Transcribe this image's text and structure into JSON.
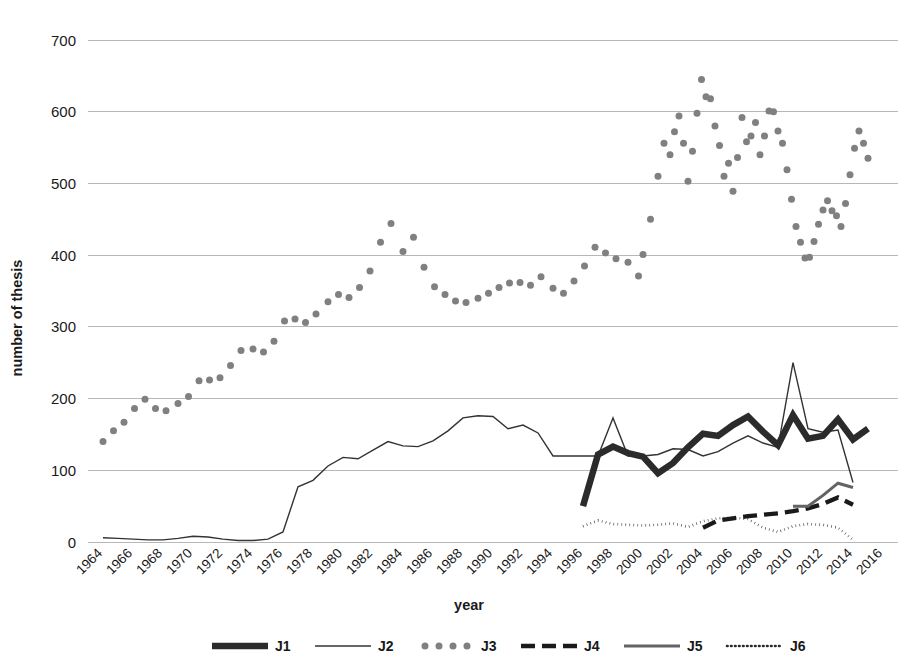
{
  "chart_data": {
    "type": "line",
    "title": "",
    "xlabel": "year",
    "ylabel": "number of thesis",
    "xlim": [
      1963,
      2017
    ],
    "ylim": [
      0,
      700
    ],
    "ytick_step": 100,
    "xtick_step": 2,
    "grid": true,
    "legend_position": "bottom",
    "yticks": [
      "0",
      "100",
      "200",
      "300",
      "400",
      "500",
      "600",
      "700"
    ],
    "xticks": [
      "1964",
      "1966",
      "1968",
      "1970",
      "1972",
      "1974",
      "1976",
      "1978",
      "1980",
      "1982",
      "1984",
      "1986",
      "1988",
      "1990",
      "1992",
      "1994",
      "1996",
      "1998",
      "2000",
      "2002",
      "2004",
      "2006",
      "2008",
      "2010",
      "2012",
      "2014",
      "2016"
    ],
    "series": [
      {
        "name": "J1",
        "style": "thick-solid",
        "color": "#2b2b2b",
        "x": [
          1996,
          1997,
          1998,
          1999,
          2000,
          2001,
          2002,
          2003,
          2004,
          2005,
          2006,
          2007,
          2008,
          2009,
          2010,
          2011,
          2012,
          2013,
          2014,
          2015
        ],
        "values": [
          50,
          122,
          133,
          124,
          119,
          96,
          110,
          132,
          151,
          148,
          163,
          175,
          154,
          135,
          177,
          144,
          148,
          171,
          143,
          158
        ]
      },
      {
        "name": "J2",
        "style": "thin-solid",
        "color": "#333333",
        "x": [
          1964,
          1965,
          1966,
          1967,
          1968,
          1969,
          1970,
          1971,
          1972,
          1973,
          1974,
          1975,
          1976,
          1977,
          1978,
          1979,
          1980,
          1981,
          1982,
          1983,
          1984,
          1985,
          1986,
          1987,
          1988,
          1989,
          1990,
          1991,
          1992,
          1993,
          1994,
          1995,
          1996,
          1997,
          1998,
          1999,
          2000,
          2001,
          2002,
          2003,
          2004,
          2005,
          2006,
          2007,
          2008,
          2009,
          2010,
          2011,
          2012,
          2013,
          2014
        ],
        "values": [
          6,
          5,
          4,
          3,
          3,
          5,
          8,
          7,
          4,
          2,
          2,
          4,
          14,
          77,
          86,
          106,
          118,
          116,
          128,
          140,
          134,
          133,
          141,
          155,
          173,
          176,
          175,
          158,
          163,
          152,
          120,
          120,
          120,
          120,
          173,
          120,
          120,
          122,
          130,
          129,
          120,
          126,
          138,
          148,
          138,
          132,
          250,
          158,
          153,
          156,
          83
        ]
      },
      {
        "name": "J3",
        "style": "dotted-markers",
        "color": "#808080",
        "x": [
          1964,
          1965,
          1966,
          1967,
          1968,
          1969,
          1970,
          1971,
          1972,
          1973,
          1974,
          1975,
          1976,
          1977,
          1978,
          1979,
          1980,
          1981,
          1982,
          1983,
          1984,
          1985,
          1986,
          1987,
          1988,
          1989,
          1990,
          1991,
          1992,
          1993,
          1994,
          1995,
          1996,
          1997,
          1998,
          1999,
          2000,
          2001,
          2002,
          2003,
          2004,
          2005,
          2006,
          2007,
          2008,
          2009,
          2010,
          2011,
          2012,
          2013,
          2014,
          2015
        ],
        "values": [
          140,
          155,
          172,
          186,
          199,
          186,
          183,
          193,
          210,
          225,
          226,
          229,
          246,
          267,
          269,
          265,
          308,
          311,
          306,
          335,
          345,
          341,
          378,
          418,
          444,
          405,
          370,
          336,
          345,
          334,
          336,
          340,
          347,
          361,
          362,
          358,
          370,
          354,
          347,
          364,
          385,
          411,
          403,
          395,
          390,
          371,
          401,
          394,
          412,
          455,
          502,
          554
        ],
        "dense_sampling_note": "markers plotted several times per year"
      },
      {
        "name": "J4",
        "style": "bold-dashed",
        "color": "#1a1a1a",
        "x": [
          2004,
          2005,
          2006,
          2007,
          2008,
          2009,
          2010,
          2011,
          2012,
          2013,
          2014
        ],
        "values": [
          20,
          30,
          33,
          36,
          38,
          40,
          43,
          47,
          53,
          62,
          52
        ]
      },
      {
        "name": "J5",
        "style": "medium-solid-gray",
        "color": "#636363",
        "x": [
          2010,
          2011,
          2012,
          2013,
          2014
        ],
        "values": [
          50,
          50,
          65,
          82,
          76
        ]
      },
      {
        "name": "J6",
        "style": "fine-dotted",
        "color": "#2b2b2b",
        "x": [
          1996,
          1997,
          1998,
          1999,
          2000,
          2001,
          2002,
          2003,
          2004,
          2005,
          2006,
          2007,
          2008,
          2009,
          2010,
          2011,
          2012,
          2013,
          2014
        ],
        "values": [
          22,
          30,
          25,
          24,
          23,
          24,
          26,
          21,
          29,
          33,
          34,
          32,
          20,
          14,
          22,
          25,
          24,
          20,
          3
        ]
      }
    ],
    "j3_dense_points": [
      [
        1964.0,
        140
      ],
      [
        1964.7,
        155
      ],
      [
        1965.4,
        167
      ],
      [
        1966.1,
        186
      ],
      [
        1966.8,
        199
      ],
      [
        1967.5,
        186
      ],
      [
        1968.2,
        183
      ],
      [
        1969.0,
        193
      ],
      [
        1969.7,
        203
      ],
      [
        1970.4,
        225
      ],
      [
        1971.1,
        226
      ],
      [
        1971.8,
        229
      ],
      [
        1972.5,
        246
      ],
      [
        1973.2,
        267
      ],
      [
        1974.0,
        269
      ],
      [
        1974.7,
        265
      ],
      [
        1975.4,
        280
      ],
      [
        1976.1,
        308
      ],
      [
        1976.8,
        311
      ],
      [
        1977.5,
        306
      ],
      [
        1978.2,
        318
      ],
      [
        1979.0,
        335
      ],
      [
        1979.7,
        345
      ],
      [
        1980.4,
        341
      ],
      [
        1981.1,
        355
      ],
      [
        1981.8,
        378
      ],
      [
        1982.5,
        418
      ],
      [
        1983.2,
        444
      ],
      [
        1984.0,
        405
      ],
      [
        1984.7,
        425
      ],
      [
        1985.4,
        383
      ],
      [
        1986.1,
        356
      ],
      [
        1986.8,
        345
      ],
      [
        1987.5,
        336
      ],
      [
        1988.2,
        334
      ],
      [
        1989.0,
        340
      ],
      [
        1989.7,
        347
      ],
      [
        1990.4,
        355
      ],
      [
        1991.1,
        361
      ],
      [
        1991.8,
        362
      ],
      [
        1992.5,
        358
      ],
      [
        1993.2,
        370
      ],
      [
        1994.0,
        354
      ],
      [
        1994.7,
        347
      ],
      [
        1995.4,
        364
      ],
      [
        1996.1,
        385
      ],
      [
        1996.8,
        411
      ],
      [
        1997.5,
        403
      ],
      [
        1998.2,
        395
      ],
      [
        1999.0,
        390
      ],
      [
        1999.7,
        371
      ],
      [
        2000.0,
        401
      ],
      [
        2000.5,
        450
      ],
      [
        2001.0,
        510
      ],
      [
        2001.4,
        556
      ],
      [
        2001.8,
        540
      ],
      [
        2002.1,
        572
      ],
      [
        2002.4,
        594
      ],
      [
        2002.7,
        556
      ],
      [
        2003.0,
        503
      ],
      [
        2003.3,
        545
      ],
      [
        2003.6,
        598
      ],
      [
        2003.9,
        645
      ],
      [
        2004.2,
        621
      ],
      [
        2004.5,
        618
      ],
      [
        2004.8,
        580
      ],
      [
        2005.1,
        553
      ],
      [
        2005.4,
        510
      ],
      [
        2005.7,
        528
      ],
      [
        2006.0,
        489
      ],
      [
        2006.3,
        536
      ],
      [
        2006.6,
        592
      ],
      [
        2006.9,
        558
      ],
      [
        2007.2,
        566
      ],
      [
        2007.5,
        585
      ],
      [
        2007.8,
        540
      ],
      [
        2008.1,
        566
      ],
      [
        2008.4,
        601
      ],
      [
        2008.7,
        600
      ],
      [
        2009.0,
        573
      ],
      [
        2009.3,
        556
      ],
      [
        2009.6,
        519
      ],
      [
        2009.9,
        478
      ],
      [
        2010.2,
        440
      ],
      [
        2010.5,
        418
      ],
      [
        2010.8,
        396
      ],
      [
        2011.1,
        397
      ],
      [
        2011.4,
        419
      ],
      [
        2011.7,
        443
      ],
      [
        2012.0,
        463
      ],
      [
        2012.3,
        476
      ],
      [
        2012.6,
        462
      ],
      [
        2012.9,
        455
      ],
      [
        2013.2,
        440
      ],
      [
        2013.5,
        472
      ],
      [
        2013.8,
        512
      ],
      [
        2014.1,
        549
      ],
      [
        2014.4,
        573
      ],
      [
        2014.7,
        556
      ],
      [
        2015.0,
        535
      ]
    ]
  },
  "legend": {
    "entries": [
      {
        "label": "J1"
      },
      {
        "label": "J2"
      },
      {
        "label": "J3"
      },
      {
        "label": "J4"
      },
      {
        "label": "J5"
      },
      {
        "label": "J6"
      }
    ]
  },
  "colors": {
    "gridline": "#b7b7b7",
    "background": "#ffffff",
    "text": "#1a1a1a",
    "j1": "#2b2b2b",
    "j2": "#333333",
    "j3": "#808080",
    "j4": "#1a1a1a",
    "j5": "#636363",
    "j6": "#2b2b2b"
  }
}
